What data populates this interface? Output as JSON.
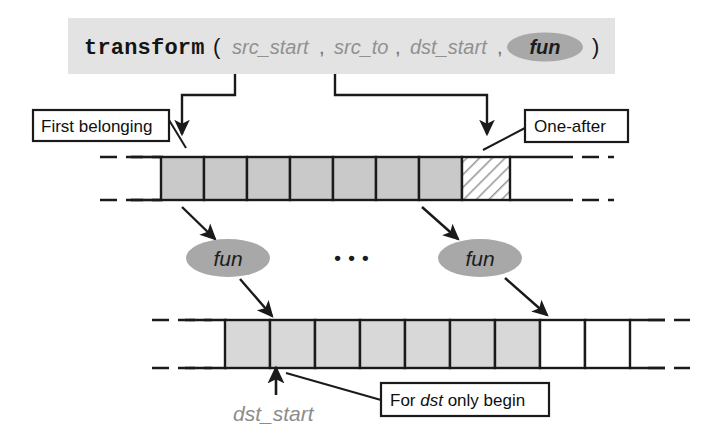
{
  "diagram": {
    "title_signature": {
      "function_name": "transform",
      "open_paren": "(",
      "close_paren": ")",
      "comma": ",",
      "params": [
        {
          "label": "src_start",
          "style": "italic-gray"
        },
        {
          "label": "src_to",
          "style": "italic-gray"
        },
        {
          "label": "dst_start",
          "style": "italic-gray"
        },
        {
          "label": "fun",
          "style": "italic-ellipse"
        }
      ],
      "band_color": "#e3e3e3",
      "ellipse_color": "#a8a8a8"
    },
    "callout_boxes": [
      {
        "id": "first-belonging",
        "text": "First belonging"
      },
      {
        "id": "one-after",
        "text": "One-after"
      },
      {
        "id": "for-dst-only-begin",
        "text_parts": [
          "For ",
          "dst",
          " only begin"
        ],
        "text": "For dst only begin"
      }
    ],
    "labels": [
      {
        "id": "dst-start-label",
        "text": "dst_start",
        "color": "#8c8c8c"
      }
    ],
    "operators": [
      {
        "id": "fun-left",
        "text": "fun"
      },
      {
        "id": "fun-right",
        "text": "fun"
      }
    ],
    "ellipsis": "•  •  •",
    "source_array": {
      "id": "source-array",
      "total_cells": 8,
      "filled_cells": 7,
      "hatched_cells": 1,
      "fill_color": "#c9c9c9",
      "hatch_color": "#ffffff",
      "dashed_ends": true
    },
    "dest_array": {
      "id": "dest-array",
      "total_cells": 9,
      "filled_cells": 7,
      "empty_cells": 2,
      "fill_color": "#d7d7d7",
      "dashed_ends": true
    },
    "colors": {
      "stroke": "#1a1a1a",
      "gray_text": "#8c8c8c",
      "band": "#e3e3e3",
      "ellipse": "#a8a8a8",
      "cell_fill_top": "#c9c9c9",
      "cell_fill_bottom": "#d8d8d8",
      "background": "#ffffff"
    }
  }
}
